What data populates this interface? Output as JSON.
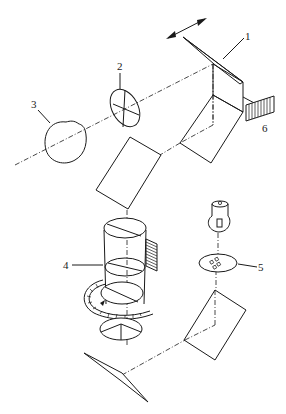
{
  "diagram": {
    "type": "optical-path-schematic",
    "labels": [
      {
        "id": "1",
        "text": "1"
      },
      {
        "id": "2",
        "text": "2"
      },
      {
        "id": "3",
        "text": "3"
      },
      {
        "id": "4",
        "text": "4"
      },
      {
        "id": "5",
        "text": "5"
      },
      {
        "id": "6",
        "text": "6"
      }
    ],
    "components": [
      {
        "name": "scanning-mirror",
        "label": "1"
      },
      {
        "name": "lens",
        "label": "2"
      },
      {
        "name": "light-source-sphere",
        "label": "3"
      },
      {
        "name": "filter-turret-cylinder",
        "label": "4"
      },
      {
        "name": "specimen-slide",
        "label": "5"
      },
      {
        "name": "detector-grating",
        "label": "6"
      }
    ],
    "colors": {
      "line": "#1a1a1a",
      "background": "#ffffff"
    }
  }
}
